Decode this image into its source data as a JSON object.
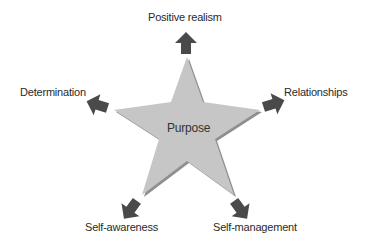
{
  "diagram": {
    "center": {
      "label": "Purpose"
    },
    "nodes": [
      {
        "id": "top",
        "label": "Positive realism"
      },
      {
        "id": "right",
        "label": "Relationships"
      },
      {
        "id": "bottom-right",
        "label": "Self-management"
      },
      {
        "id": "bottom-left",
        "label": "Self-awareness"
      },
      {
        "id": "left",
        "label": "Determination"
      }
    ],
    "colors": {
      "star_fill": "#c6c6c6",
      "star_edge": "#8f8f8f",
      "arrow_fill": "#4a4a4a",
      "text": "#2a2a2a"
    }
  }
}
